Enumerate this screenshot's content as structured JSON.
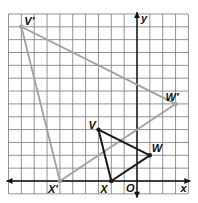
{
  "diagram": {
    "type": "coordinate-plane-dilation",
    "grid": {
      "xmin": -10,
      "xmax": 4,
      "ymin": -1,
      "ymax": 13,
      "cell_px": 12.85,
      "origin_px": [
        137,
        181
      ]
    },
    "axes": {
      "x_label": "x",
      "y_label": "y",
      "origin_label": "O"
    },
    "original": {
      "color": "#1a1a1a",
      "points": [
        {
          "name": "V",
          "label": "V",
          "x": -3,
          "y": 4
        },
        {
          "name": "W",
          "label": "W",
          "x": 1,
          "y": 2
        },
        {
          "name": "X",
          "label": "X",
          "x": -2,
          "y": 0
        }
      ]
    },
    "image": {
      "color": "#a0a0a0",
      "points": [
        {
          "name": "V'",
          "label": "V′",
          "x": -9,
          "y": 12
        },
        {
          "name": "W'",
          "label": "W′",
          "x": 3,
          "y": 6
        },
        {
          "name": "X'",
          "label": "X′",
          "x": -6,
          "y": 0
        }
      ]
    }
  }
}
